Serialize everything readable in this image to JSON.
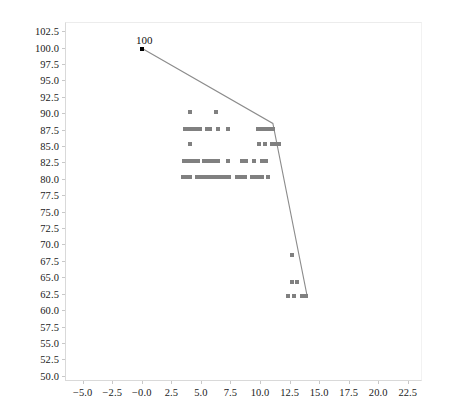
{
  "chart_data": {
    "type": "scatter",
    "title": "",
    "xlabel": "",
    "ylabel": "",
    "xlim": [
      -6.5,
      23.7
    ],
    "ylim": [
      49.2,
      103.9
    ],
    "grid": false,
    "legend": null,
    "xticks": [
      "-5.0",
      "-2.5",
      "-0.0",
      "2.5",
      "5.0",
      "7.5",
      "10.0",
      "12.5",
      "15.0",
      "17.5",
      "20.0",
      "22.5"
    ],
    "xtick_values": [
      -5.0,
      -2.5,
      -0.0,
      2.5,
      5.0,
      7.5,
      10.0,
      12.5,
      15.0,
      17.5,
      20.0,
      22.5
    ],
    "yticks": [
      "50.0",
      "52.5",
      "55.0",
      "57.5",
      "60.0",
      "62.5",
      "65.0",
      "67.5",
      "70.0",
      "72.5",
      "75.0",
      "77.5",
      "80.0",
      "82.5",
      "85.0",
      "87.5",
      "90.0",
      "92.5",
      "95.0",
      "97.5",
      "100.0",
      "102.5"
    ],
    "ytick_values": [
      50.0,
      52.5,
      55.0,
      57.5,
      60.0,
      62.5,
      65.0,
      67.5,
      70.0,
      72.5,
      75.0,
      77.5,
      80.0,
      82.5,
      85.0,
      87.5,
      90.0,
      92.5,
      95.0,
      97.5,
      100.0,
      102.5
    ],
    "annotations": [
      {
        "text": "100",
        "x": -0.05,
        "y": 100.0
      }
    ],
    "series": [
      {
        "name": "scatter-points",
        "type": "scatter",
        "color": "#808080",
        "marker": "square",
        "points": [
          [
            4.0,
            90.3
          ],
          [
            6.2,
            90.4
          ],
          [
            3.6,
            87.7
          ],
          [
            3.9,
            87.7
          ],
          [
            4.2,
            87.7
          ],
          [
            4.5,
            87.7
          ],
          [
            4.8,
            87.7
          ],
          [
            5.4,
            87.7
          ],
          [
            5.7,
            87.7
          ],
          [
            6.4,
            87.7
          ],
          [
            7.2,
            87.7
          ],
          [
            9.7,
            87.7
          ],
          [
            10.1,
            87.7
          ],
          [
            10.4,
            87.7
          ],
          [
            10.7,
            87.7
          ],
          [
            11.0,
            87.7
          ],
          [
            4.0,
            85.5
          ],
          [
            9.8,
            85.4
          ],
          [
            10.3,
            85.4
          ],
          [
            10.9,
            85.4
          ],
          [
            11.2,
            85.4
          ],
          [
            11.5,
            85.4
          ],
          [
            3.5,
            82.8
          ],
          [
            3.8,
            82.8
          ],
          [
            4.1,
            82.8
          ],
          [
            4.4,
            82.8
          ],
          [
            4.7,
            82.8
          ],
          [
            5.2,
            82.8
          ],
          [
            5.5,
            82.8
          ],
          [
            5.8,
            82.8
          ],
          [
            6.1,
            82.8
          ],
          [
            6.4,
            82.8
          ],
          [
            7.2,
            82.8
          ],
          [
            8.4,
            82.8
          ],
          [
            8.7,
            82.8
          ],
          [
            9.4,
            82.8
          ],
          [
            10.1,
            82.8
          ],
          [
            10.4,
            82.8
          ],
          [
            3.4,
            80.5
          ],
          [
            3.7,
            80.5
          ],
          [
            4.0,
            80.5
          ],
          [
            4.6,
            80.5
          ],
          [
            4.9,
            80.5
          ],
          [
            5.2,
            80.5
          ],
          [
            5.5,
            80.5
          ],
          [
            5.8,
            80.5
          ],
          [
            6.1,
            80.5
          ],
          [
            6.4,
            80.5
          ],
          [
            6.7,
            80.5
          ],
          [
            7.0,
            80.5
          ],
          [
            7.3,
            80.5
          ],
          [
            8.0,
            80.5
          ],
          [
            8.3,
            80.5
          ],
          [
            8.6,
            80.5
          ],
          [
            9.2,
            80.5
          ],
          [
            9.5,
            80.5
          ],
          [
            9.8,
            80.5
          ],
          [
            10.1,
            80.5
          ],
          [
            10.6,
            80.5
          ],
          [
            12.6,
            68.5
          ],
          [
            12.6,
            64.5
          ],
          [
            13.0,
            64.5
          ],
          [
            12.3,
            62.3
          ],
          [
            12.8,
            62.3
          ],
          [
            13.5,
            62.3
          ],
          [
            13.8,
            62.3
          ]
        ]
      },
      {
        "name": "trend-line",
        "type": "line",
        "color": "#8c8c8c",
        "points": [
          [
            -0.05,
            100.0
          ],
          [
            11.0,
            88.6
          ],
          [
            13.9,
            62.3
          ]
        ]
      }
    ]
  },
  "figure": {
    "background": "#ffffff",
    "plot_background": "#ffffff",
    "axis_color": "#d9d9d9",
    "tick_color": "#c8c8c8",
    "text_color": "#1a1a1a",
    "point_color": "#808080",
    "line_color": "#8c8c8c",
    "annotation_color": "#111111"
  }
}
